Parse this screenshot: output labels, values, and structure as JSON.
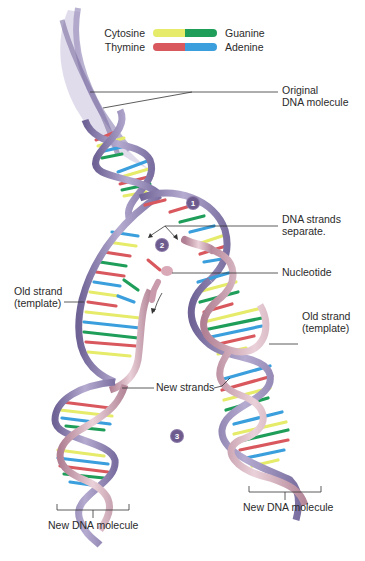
{
  "legend": {
    "rows": [
      {
        "left_label": "Cytosine",
        "right_label": "Guanine",
        "left_color": "#e6eb6a",
        "right_color": "#1f9e5a"
      },
      {
        "left_label": "Thymine",
        "right_label": "Adenine",
        "left_color": "#d9585e",
        "right_color": "#3a9fdc"
      }
    ]
  },
  "labels": {
    "original_dna": [
      "Original",
      "DNA molecule"
    ],
    "strands_separate": [
      "DNA strands",
      "separate."
    ],
    "nucleotide": "Nucleotide",
    "old_strand_left": [
      "Old strand",
      "(template)"
    ],
    "old_strand_right": [
      "Old strand",
      "(template)"
    ],
    "new_strands": "New strands",
    "new_dna_left": "New DNA molecule",
    "new_dna_right": "New DNA molecule"
  },
  "steps": [
    "1",
    "2",
    "3"
  ],
  "colors": {
    "old_strand": "#8e82b0",
    "new_strand": "#c99aab",
    "leader_line": "#333333",
    "step_badge": "#6e5b8e"
  }
}
